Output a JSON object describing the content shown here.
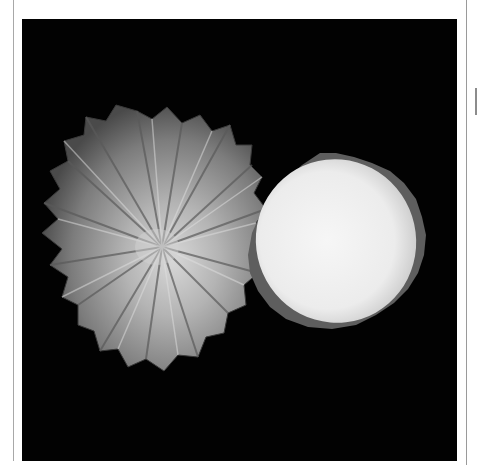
{
  "image": {
    "subject": "two-shells",
    "description": "Two limpet-like shells on black background: ribbed exterior (left) and white nacre interior (right)",
    "background_color": "#020202",
    "frame_color": "#ffffff",
    "border_color": "#a8a8a8"
  }
}
